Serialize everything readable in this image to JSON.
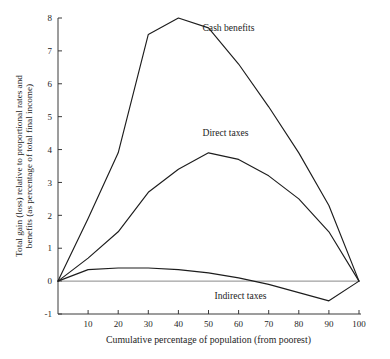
{
  "chart_data": {
    "type": "line",
    "title": "",
    "xlabel": "Cumulative percentage of population (from poorest)",
    "ylabel": "Total gain (loss) relative to proportional rates and benefits (as percentage of total final income)",
    "ylabel_line1": "Total gain (loss) relative to proportional rates and",
    "ylabel_line2": "benefits (as percentage of total final income)",
    "xlim": [
      0,
      100
    ],
    "ylim": [
      -1,
      8
    ],
    "xticks": [
      10,
      20,
      30,
      40,
      50,
      60,
      70,
      80,
      90,
      100
    ],
    "yticks": [
      -1,
      0,
      1,
      2,
      3,
      4,
      5,
      6,
      7,
      8
    ],
    "xtick_labels": [
      "10",
      "20",
      "30",
      "40",
      "50",
      "60",
      "70",
      "80",
      "90",
      "100"
    ],
    "ytick_labels": [
      "-1",
      "0",
      "1",
      "2",
      "3",
      "4",
      "5",
      "6",
      "7",
      "8"
    ],
    "grid": false,
    "legend_position": "inline-annotations",
    "zero_line": true,
    "x": [
      0,
      10,
      20,
      30,
      40,
      50,
      60,
      70,
      80,
      90,
      100
    ],
    "series": [
      {
        "name": "Cash benefits",
        "label_x": 48,
        "label_y": 7.6,
        "values": [
          0.0,
          1.9,
          3.9,
          7.5,
          8.0,
          7.7,
          6.6,
          5.3,
          3.9,
          2.3,
          0.0
        ]
      },
      {
        "name": "Direct taxes",
        "label_x": 48,
        "label_y": 4.4,
        "values": [
          0.0,
          0.7,
          1.5,
          2.7,
          3.4,
          3.9,
          3.7,
          3.2,
          2.5,
          1.5,
          0.0
        ]
      },
      {
        "name": "Indirect taxes",
        "label_x": 52,
        "label_y": -0.55,
        "values": [
          0.0,
          0.35,
          0.4,
          0.4,
          0.35,
          0.25,
          0.1,
          -0.1,
          -0.35,
          -0.6,
          0.0
        ]
      }
    ]
  },
  "colors": {
    "axis": "#3a3a3a",
    "line": "#1d1d1d",
    "zero_line": "#8a8a8a",
    "background": "#ffffff"
  }
}
